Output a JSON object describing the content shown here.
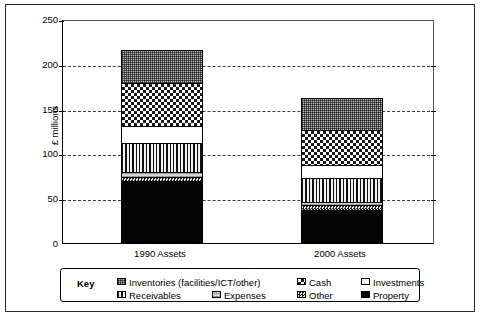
{
  "chart_data": {
    "type": "bar",
    "subtype": "stacked-bar",
    "title": "",
    "xlabel": "",
    "ylabel": "£ millions",
    "ylim": [
      0,
      250
    ],
    "yticks": [
      0,
      50,
      100,
      150,
      200,
      250
    ],
    "ytick_labels": [
      "0",
      "50",
      "100",
      "150",
      "200",
      "250"
    ],
    "grid": "horizontal-dashed",
    "legend_position": "bottom",
    "legend_title": "Key",
    "categories": [
      "1990 Assets",
      "2000 Assets"
    ],
    "series": [
      {
        "name": "Property",
        "pattern": "solid-black",
        "values": [
          68,
          36
        ]
      },
      {
        "name": "Other",
        "pattern": "fine-checker",
        "values": [
          5,
          5
        ]
      },
      {
        "name": "Expenses",
        "pattern": "light-horizontal",
        "values": [
          5,
          4
        ]
      },
      {
        "name": "Receivables",
        "pattern": "vertical-stripes",
        "values": [
          33,
          26
        ]
      },
      {
        "name": "Investments",
        "pattern": "white",
        "values": [
          19,
          15
        ]
      },
      {
        "name": "Cash",
        "pattern": "large-checker",
        "values": [
          47,
          39
        ]
      },
      {
        "name": "Inventories (facilities/ICT/other)",
        "pattern": "fine-grey-dots",
        "values": [
          36,
          35
        ]
      }
    ],
    "totals": [
      213,
      160
    ]
  },
  "axis": {
    "y_title": "£ millions",
    "y_ticks": [
      "250",
      "200",
      "150",
      "100",
      "50",
      "0"
    ],
    "x_categories": [
      "1990 Assets",
      "2000 Assets"
    ]
  },
  "legend": {
    "title": "Key",
    "rows": [
      [
        {
          "label": "Inventories (facilities/ICT/other)",
          "swatch": "fine-grey-dots"
        },
        {
          "label": "Cash",
          "swatch": "large-checker"
        },
        {
          "label": "Investments",
          "swatch": "white"
        }
      ],
      [
        {
          "label": "Receivables",
          "swatch": "vertical-stripes"
        },
        {
          "label": "Expenses",
          "swatch": "light-horizontal"
        },
        {
          "label": "Other",
          "swatch": "fine-checker"
        },
        {
          "label": "Property",
          "swatch": "solid-black"
        }
      ]
    ]
  },
  "colors": {
    "frame": "#2b2b2b",
    "axis": "#000000",
    "grid": "#3a3a3a",
    "background": "#ffffff",
    "property": "#050505",
    "inventories": "#b8b8b8",
    "cash": "#ffffff",
    "receivables": "#e8e8e8",
    "investments": "#ffffff",
    "expenses": "#d8d8d8",
    "other": "#c9c9c9"
  }
}
